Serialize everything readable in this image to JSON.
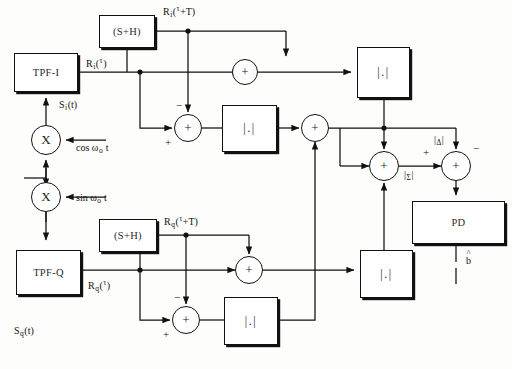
{
  "diagram": {
    "blocks": [
      {
        "id": "tpf_i",
        "label": "TPF-I",
        "x": 14,
        "y": 53,
        "w": 64,
        "h": 39
      },
      {
        "id": "sh_i",
        "label": "(S+H)",
        "x": 99,
        "y": 15,
        "w": 56,
        "h": 33
      },
      {
        "id": "abs_i1",
        "label": "|.|",
        "x": 222,
        "y": 105,
        "w": 55,
        "h": 47
      },
      {
        "id": "abs_i2",
        "label": "|.|",
        "x": 357,
        "y": 47,
        "w": 53,
        "h": 51
      },
      {
        "id": "tpf_q",
        "label": "TPF-Q",
        "x": 16,
        "y": 250,
        "w": 65,
        "h": 45
      },
      {
        "id": "sh_q",
        "label": "(S+H)",
        "x": 99,
        "y": 219,
        "w": 58,
        "h": 33
      },
      {
        "id": "abs_q1",
        "label": "|.|",
        "x": 224,
        "y": 297,
        "w": 54,
        "h": 48
      },
      {
        "id": "abs_q2",
        "label": "|.|",
        "x": 360,
        "y": 250,
        "w": 53,
        "h": 48
      },
      {
        "id": "pd",
        "label": "PD",
        "x": 412,
        "y": 201,
        "w": 93,
        "h": 43
      }
    ],
    "circles": [
      {
        "id": "mult_i",
        "label": "X",
        "cx": 46,
        "cy": 140,
        "r": 15
      },
      {
        "id": "mult_q",
        "label": "X",
        "cx": 46,
        "cy": 197,
        "r": 15
      },
      {
        "id": "sum_i_t",
        "label": "+",
        "cx": 245,
        "cy": 72,
        "r": 13
      },
      {
        "id": "sum_i_d",
        "label": "+",
        "cx": 188,
        "cy": 128,
        "r": 14
      },
      {
        "id": "sum_mid",
        "label": "+",
        "cx": 315,
        "cy": 128,
        "r": 14
      },
      {
        "id": "sum_q_t",
        "label": "+",
        "cx": 249,
        "cy": 270,
        "r": 14
      },
      {
        "id": "sum_q_d",
        "label": "+",
        "cx": 186,
        "cy": 320,
        "r": 14
      },
      {
        "id": "sum_sig",
        "label": "+",
        "cx": 384,
        "cy": 166,
        "r": 15
      },
      {
        "id": "sum_cmp",
        "label": "+",
        "cx": 456,
        "cy": 166,
        "r": 15
      }
    ],
    "signal_labels": {
      "r_i_tau": {
        "base": "R",
        "sub": "i",
        "mid": "(",
        "sup": "τ",
        "tail": ")",
        "x": 86,
        "y": 57
      },
      "r_i_tau_t": {
        "base": "R",
        "sub": "i",
        "mid": "(",
        "sup": "τ",
        "tail": "+T)",
        "x": 163,
        "y": 5
      },
      "r_q_tau": {
        "base": "R",
        "sub": "q",
        "mid": "(",
        "sup": "τ",
        "tail": ")",
        "x": 88,
        "y": 279
      },
      "r_q_tau_t": {
        "base": "R",
        "sub": "q",
        "mid": "(",
        "sup": "τ",
        "tail": "+T)",
        "x": 164,
        "y": 215
      },
      "s_i_t": {
        "base": "S",
        "sub": "i",
        "tail": "(t)",
        "x": 59,
        "y": 100
      },
      "s_q_t": {
        "base": "S",
        "sub": "q",
        "tail": "(t)",
        "x": 14,
        "y": 326
      },
      "cos_lo": {
        "base": "cos",
        "greek": "ω",
        "sub": "o",
        "tail": "t",
        "x": 76,
        "y": 143
      },
      "sin_lo": {
        "base": "sin",
        "greek": "ω",
        "sub": "o",
        "tail": "t",
        "x": 76,
        "y": 193
      },
      "abs_delta": {
        "text": "|",
        "sub": "Δ",
        "tail": "|",
        "x": 434,
        "y": 135
      },
      "abs_sigma": {
        "text": "|",
        "sub": "Σ",
        "tail": "|",
        "x": 404,
        "y": 170
      },
      "b_hat": {
        "hat": "˄",
        "base": "b",
        "x": 466,
        "y": 252
      }
    },
    "sign_marks": [
      {
        "id": "minus-sum-i-d",
        "text": "−",
        "x": 176,
        "y": 104
      },
      {
        "id": "plus-sum-i-d",
        "text": "+",
        "x": 165,
        "y": 140
      },
      {
        "id": "minus-sum-q-d",
        "text": "−",
        "x": 174,
        "y": 296
      },
      {
        "id": "plus-sum-q-d",
        "text": "+",
        "x": 163,
        "y": 332
      },
      {
        "id": "plus-sum-cmp",
        "text": "+",
        "x": 423,
        "y": 150
      },
      {
        "id": "minus-sum-cmp",
        "text": "−",
        "x": 472,
        "y": 146
      }
    ],
    "colors": {
      "stroke": "#111111",
      "fill": "#ffffff",
      "page": "#fdfdfb"
    }
  }
}
